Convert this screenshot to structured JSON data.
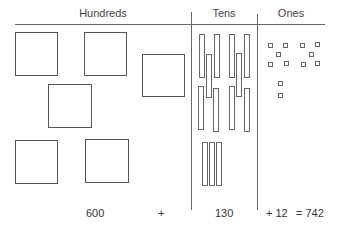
{
  "headers": {
    "hundreds": "Hundreds",
    "tens": "Tens",
    "ones": "Ones"
  },
  "equation": {
    "hundreds_value": "600",
    "plus1": "+",
    "tens_value": "130",
    "ones_part": "+ 12",
    "result": "= 742"
  },
  "counts": {
    "hundreds_squares": 6,
    "tens_rods": 13,
    "ones_units": 12
  },
  "colors": {
    "stroke": "#555555",
    "background": "#ffffff"
  }
}
